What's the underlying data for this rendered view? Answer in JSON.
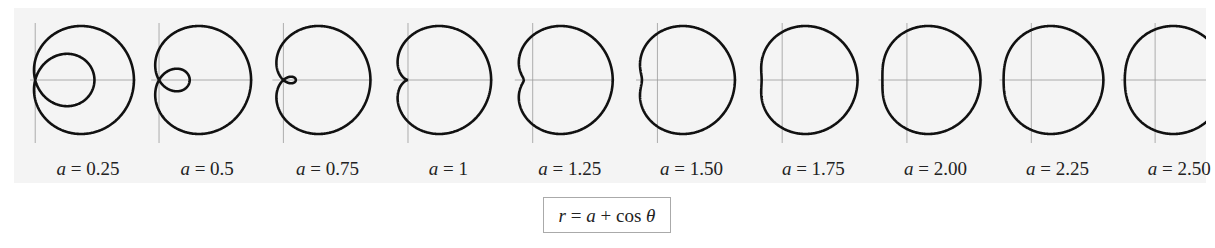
{
  "chart_data": {
    "type": "line",
    "title": "r = a + cos θ",
    "formula": "r = a + cos θ",
    "series": [
      {
        "name": "a = 0.25",
        "a": 0.25
      },
      {
        "name": "a = 0.5",
        "a": 0.5
      },
      {
        "name": "a = 0.75",
        "a": 0.75
      },
      {
        "name": "a = 1",
        "a": 1
      },
      {
        "name": "a = 1.25",
        "a": 1.25
      },
      {
        "name": "a = 1.50",
        "a": 1.5
      },
      {
        "name": "a = 1.75",
        "a": 1.75
      },
      {
        "name": "a = 2.00",
        "a": 2.0
      },
      {
        "name": "a = 2.25",
        "a": 2.25
      },
      {
        "name": "a = 2.50",
        "a": 2.5
      }
    ],
    "xlabel": "",
    "ylabel": "",
    "grid": false,
    "axes": "polar axes through origin"
  },
  "labels": [
    {
      "var": "a",
      "value": "= 0.25"
    },
    {
      "var": "a",
      "value": "= 0.5"
    },
    {
      "var": "a",
      "value": "= 0.75"
    },
    {
      "var": "a",
      "value": "= 1"
    },
    {
      "var": "a",
      "value": "= 1.25"
    },
    {
      "var": "a",
      "value": "= 1.50"
    },
    {
      "var": "a",
      "value": "= 1.75"
    },
    {
      "var": "a",
      "value": "= 2.00"
    },
    {
      "var": "a",
      "value": "= 2.25"
    },
    {
      "var": "a",
      "value": "= 2.50"
    }
  ],
  "formula_box": "r = a + cos θ",
  "colors": {
    "curve": "#111111",
    "axis": "#9a9a9a",
    "panel": "#f4f4f4"
  }
}
